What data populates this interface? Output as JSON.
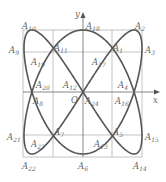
{
  "figure": {
    "type": "lissajous-curve-with-grid",
    "axes": {
      "x_label": "x",
      "y_label": "y",
      "origin_label": "O"
    },
    "points": [
      {
        "name": "A",
        "sub": "1",
        "x": 113,
        "y": 44
      },
      {
        "name": "A",
        "sub": "2",
        "x": 135,
        "y": 22
      },
      {
        "name": "A",
        "sub": "3",
        "x": 145,
        "y": 46
      },
      {
        "name": "A",
        "sub": "4",
        "x": 118,
        "y": 81
      },
      {
        "name": "A",
        "sub": "5",
        "x": 113,
        "y": 128
      },
      {
        "name": "A",
        "sub": "6",
        "x": 78,
        "y": 162
      },
      {
        "name": "A",
        "sub": "7",
        "x": 54,
        "y": 128
      },
      {
        "name": "A",
        "sub": "8",
        "x": 33,
        "y": 97
      },
      {
        "name": "A",
        "sub": "9",
        "x": 9,
        "y": 46
      },
      {
        "name": "A",
        "sub": "10",
        "x": 22,
        "y": 22
      },
      {
        "name": "A",
        "sub": "11",
        "x": 54,
        "y": 44
      },
      {
        "name": "A",
        "sub": "12",
        "x": 63,
        "y": 81
      },
      {
        "name": "A",
        "sub": "13",
        "x": 94,
        "y": 140
      },
      {
        "name": "A",
        "sub": "14",
        "x": 133,
        "y": 162
      },
      {
        "name": "A",
        "sub": "15",
        "x": 145,
        "y": 133
      },
      {
        "name": "A",
        "sub": "16",
        "x": 115,
        "y": 97
      },
      {
        "name": "A",
        "sub": "17",
        "x": 92,
        "y": 58
      },
      {
        "name": "A",
        "sub": "18",
        "x": 86,
        "y": 22
      },
      {
        "name": "A",
        "sub": "19",
        "x": 31,
        "y": 58
      },
      {
        "name": "A",
        "sub": "20",
        "x": 36,
        "y": 81
      },
      {
        "name": "A",
        "sub": "21",
        "x": 7,
        "y": 133
      },
      {
        "name": "A",
        "sub": "22",
        "x": 22,
        "y": 162
      },
      {
        "name": "A",
        "sub": "23",
        "x": 31,
        "y": 140
      },
      {
        "name": "A",
        "sub": "24",
        "x": 85,
        "y": 97
      }
    ]
  }
}
